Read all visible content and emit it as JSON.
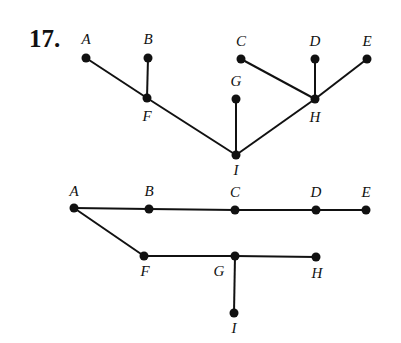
{
  "problem": {
    "number_label": "17."
  },
  "colors": {
    "ink": "#111111",
    "background": "#ffffff"
  },
  "graphs": [
    {
      "name": "tree-graph",
      "nodes": [
        {
          "id": "A",
          "label": "A",
          "x": 86,
          "y": 58,
          "lx": 86,
          "ly": 44,
          "anchor": "middle"
        },
        {
          "id": "B",
          "label": "B",
          "x": 148,
          "y": 58,
          "lx": 148,
          "ly": 44,
          "anchor": "middle"
        },
        {
          "id": "F",
          "label": "F",
          "x": 147,
          "y": 98,
          "lx": 147,
          "ly": 121,
          "anchor": "middle"
        },
        {
          "id": "C",
          "label": "C",
          "x": 241,
          "y": 59,
          "lx": 241,
          "ly": 46,
          "anchor": "middle"
        },
        {
          "id": "D",
          "label": "D",
          "x": 315,
          "y": 59,
          "lx": 315,
          "ly": 46,
          "anchor": "middle"
        },
        {
          "id": "E",
          "label": "E",
          "x": 367,
          "y": 59,
          "lx": 367,
          "ly": 46,
          "anchor": "middle"
        },
        {
          "id": "G",
          "label": "G",
          "x": 236,
          "y": 99,
          "lx": 236,
          "ly": 86,
          "anchor": "middle"
        },
        {
          "id": "H",
          "label": "H",
          "x": 315,
          "y": 99,
          "lx": 315,
          "ly": 122,
          "anchor": "middle"
        },
        {
          "id": "I",
          "label": "I",
          "x": 236,
          "y": 155,
          "lx": 236,
          "ly": 175,
          "anchor": "middle"
        }
      ],
      "edges": [
        [
          "A",
          "F"
        ],
        [
          "B",
          "F"
        ],
        [
          "F",
          "I"
        ],
        [
          "G",
          "I"
        ],
        [
          "I",
          "H"
        ],
        [
          "C",
          "H"
        ],
        [
          "D",
          "H"
        ],
        [
          "E",
          "H"
        ]
      ]
    },
    {
      "name": "path-graph",
      "nodes": [
        {
          "id": "A",
          "label": "A",
          "x": 74,
          "y": 208,
          "lx": 74,
          "ly": 196,
          "anchor": "middle"
        },
        {
          "id": "B",
          "label": "B",
          "x": 149,
          "y": 209,
          "lx": 149,
          "ly": 196,
          "anchor": "middle"
        },
        {
          "id": "C",
          "label": "C",
          "x": 235,
          "y": 210,
          "lx": 235,
          "ly": 197,
          "anchor": "middle"
        },
        {
          "id": "D",
          "label": "D",
          "x": 316,
          "y": 210,
          "lx": 316,
          "ly": 197,
          "anchor": "middle"
        },
        {
          "id": "E",
          "label": "E",
          "x": 366,
          "y": 210,
          "lx": 366,
          "ly": 197,
          "anchor": "middle"
        },
        {
          "id": "F",
          "label": "F",
          "x": 144,
          "y": 256,
          "lx": 145,
          "ly": 276,
          "anchor": "middle"
        },
        {
          "id": "G",
          "label": "G",
          "x": 235,
          "y": 256,
          "lx": 219,
          "ly": 276,
          "anchor": "middle"
        },
        {
          "id": "H",
          "label": "H",
          "x": 316,
          "y": 257,
          "lx": 317,
          "ly": 278,
          "anchor": "middle"
        },
        {
          "id": "I",
          "label": "I",
          "x": 234,
          "y": 313,
          "lx": 234,
          "ly": 333,
          "anchor": "middle"
        }
      ],
      "edges": [
        [
          "A",
          "B"
        ],
        [
          "B",
          "C"
        ],
        [
          "C",
          "D"
        ],
        [
          "D",
          "E"
        ],
        [
          "A",
          "F"
        ],
        [
          "F",
          "G"
        ],
        [
          "G",
          "H"
        ],
        [
          "G",
          "I"
        ]
      ]
    }
  ]
}
